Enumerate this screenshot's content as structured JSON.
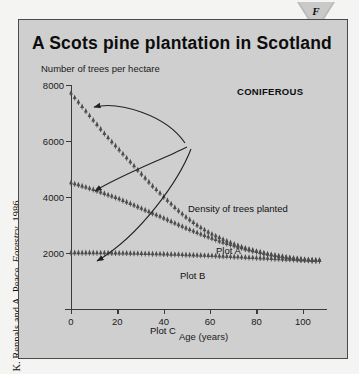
{
  "marker": {
    "letter": "F",
    "icon": "down-triangle-marker"
  },
  "credit": {
    "text": "K. Rennals and A. Peace, ",
    "italic_part": "Forestry",
    "year": ", 1986"
  },
  "panel": {
    "title": "A Scots pine plantation in Scotland",
    "category_badge": "CONIFEROUS"
  },
  "chart_data": {
    "type": "line",
    "title": "A Scots pine plantation in Scotland",
    "xlabel": "Age (years)",
    "ylabel": "Number of trees per hectare",
    "xlim": [
      0,
      110
    ],
    "ylim": [
      0,
      8000
    ],
    "xticks": [
      0,
      20,
      40,
      60,
      80,
      100
    ],
    "yticks": [
      2000,
      4000,
      6000,
      8000
    ],
    "grid": false,
    "legend_position": "inline-annotations",
    "annotations": [
      "Density of trees planted",
      "Plot A",
      "Plot B",
      "Plot C",
      "CONIFEROUS"
    ],
    "series": [
      {
        "name": "Plot A",
        "marker": "tree-glyph",
        "x": [
          0,
          5,
          10,
          15,
          20,
          25,
          30,
          35,
          40,
          45,
          50,
          55,
          60,
          65,
          70,
          75,
          80,
          85,
          90,
          95,
          100,
          105
        ],
        "values": [
          7700,
          7200,
          6700,
          6200,
          5750,
          5300,
          4850,
          4400,
          4000,
          3600,
          3250,
          2950,
          2700,
          2500,
          2320,
          2170,
          2050,
          1950,
          1870,
          1800,
          1750,
          1720
        ]
      },
      {
        "name": "Plot B",
        "marker": "tree-glyph",
        "x": [
          0,
          5,
          10,
          15,
          20,
          25,
          30,
          35,
          40,
          45,
          50,
          55,
          60,
          65,
          70,
          75,
          80,
          85,
          90,
          95,
          100,
          105
        ],
        "values": [
          4500,
          4380,
          4250,
          4100,
          3950,
          3780,
          3600,
          3420,
          3240,
          3050,
          2870,
          2700,
          2540,
          2390,
          2260,
          2140,
          2040,
          1950,
          1880,
          1820,
          1770,
          1740
        ]
      },
      {
        "name": "Plot C",
        "marker": "tree-glyph",
        "x": [
          0,
          5,
          10,
          15,
          20,
          25,
          30,
          35,
          40,
          45,
          50,
          55,
          60,
          65,
          70,
          75,
          80,
          85,
          90,
          95,
          100,
          105
        ],
        "values": [
          2000,
          2000,
          2000,
          1995,
          1990,
          1985,
          1975,
          1965,
          1955,
          1945,
          1930,
          1915,
          1900,
          1880,
          1860,
          1840,
          1820,
          1800,
          1780,
          1760,
          1740,
          1720
        ]
      }
    ]
  }
}
